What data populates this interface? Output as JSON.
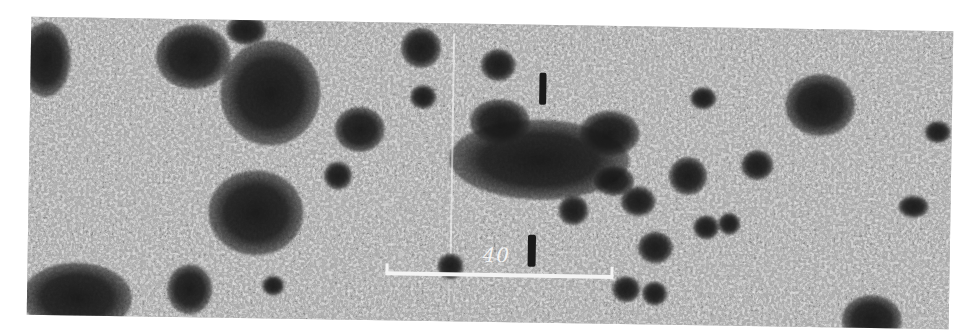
{
  "image": {
    "description": "Grayscale astronomical photographic plate showing a field of galaxies",
    "colors": {
      "background": "#ffffff",
      "plate_mid": "#9a9a9a",
      "dark_objects": "#1a1a1a",
      "scale_bar": "#f4f4f4"
    }
  },
  "scale_bar": {
    "label": "40"
  }
}
